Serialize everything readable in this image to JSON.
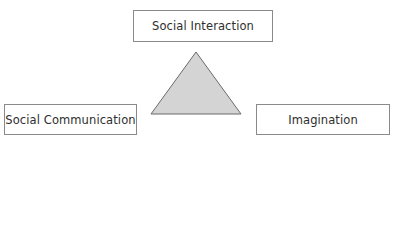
{
  "diagram": {
    "type": "triad",
    "nodes": [
      {
        "id": "top",
        "label": "Social Interaction"
      },
      {
        "id": "left",
        "label": "Social Communication"
      },
      {
        "id": "right",
        "label": "Imagination"
      }
    ],
    "center_shape": "triangle",
    "colors": {
      "triangle_fill": "#d4d4d4",
      "triangle_stroke": "#6a6a6a",
      "box_border": "#8a8a8a",
      "text": "#2e2e2e"
    }
  }
}
